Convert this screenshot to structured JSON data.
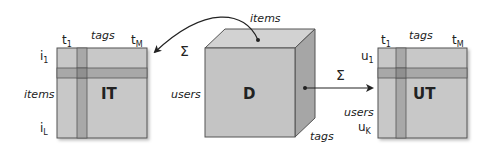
{
  "colors": {
    "matrix_fill": "#c8c8c8",
    "stripe_fill": "#a8a8a8",
    "cross_fill": "#909090",
    "border": "#555555",
    "cube_front": "#c4c4c4",
    "cube_top": "#d2d2d2",
    "cube_side": "#a6a6a6",
    "text": "#222222"
  },
  "left_matrix": {
    "name": "IT",
    "col_first": "t",
    "col_first_sub": "1",
    "col_axis": "tags",
    "col_last": "t",
    "col_last_sub": "M",
    "row_first": "i",
    "row_first_sub": "1",
    "row_axis": "items",
    "row_last": "i",
    "row_last_sub": "L"
  },
  "cube": {
    "name": "D",
    "top_axis": "items",
    "left_axis": "users",
    "depth_axis": "tags"
  },
  "right_matrix": {
    "name": "UT",
    "col_first": "t",
    "col_first_sub": "1",
    "col_axis": "tags",
    "col_last": "t",
    "col_last_sub": "M",
    "row_first": "u",
    "row_first_sub": "1",
    "row_axis": "users",
    "row_last": "u",
    "row_last_sub": "K"
  },
  "arrows": {
    "to_left_symbol": "Σ",
    "to_right_symbol": "Σ"
  }
}
